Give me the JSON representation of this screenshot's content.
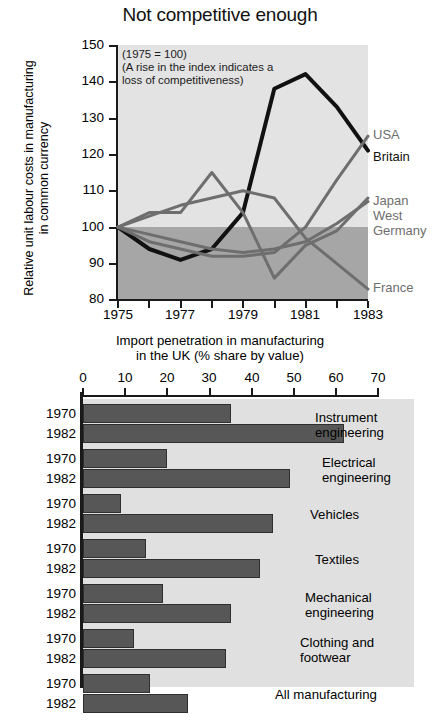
{
  "line_chart": {
    "title": "Not competitive enough",
    "ylabel": "Relative unit labour costs in manufacturing\nin common currency",
    "note": "(1975 = 100)\n(A rise in the index indicates a\nloss of competitiveness)",
    "note_lines": [
      "(1975 = 100)",
      "(A rise in the index indicates a",
      "loss of competitiveness)"
    ],
    "ytick_labels": [
      "150",
      "140",
      "130",
      "120",
      "110",
      "100",
      "90",
      "80"
    ],
    "xtick_labels": [
      "1975",
      "1977",
      "1979",
      "1981",
      "1983"
    ],
    "series_labels": [
      "USA",
      "Britain",
      "Japan",
      "West",
      "Germany",
      "France"
    ]
  },
  "bar_chart": {
    "title_lines": [
      "Import penetration in manufacturing",
      "in the UK (% share by value)"
    ],
    "xtick_labels": [
      "0",
      "10",
      "20",
      "30",
      "40",
      "50",
      "60",
      "70"
    ],
    "year_labels": [
      "1970",
      "1982"
    ],
    "category_labels": [
      [
        "Instrument",
        "engineering"
      ],
      [
        "Electrical",
        "engineering"
      ],
      [
        "Vehicles"
      ],
      [
        "Textiles"
      ],
      [
        "Mechanical",
        "engineering"
      ],
      [
        "Clothing and",
        "footwear"
      ],
      [
        "All manufacturing"
      ]
    ]
  },
  "footer": {
    "text": ""
  },
  "colors": {
    "plot_light": "#e3e3e3",
    "plot_dark": "#a6a6a6",
    "bar_fill": "#575757",
    "bar_bg": "#e0e0e0",
    "line_black": "#111111",
    "line_gray": "#6e6e6e"
  },
  "chart_data": [
    {
      "type": "line",
      "title": "Not competitive enough",
      "xlabel": "",
      "ylabel": "Relative unit labour costs in manufacturing in common currency",
      "subtitle": "(1975 = 100) (A rise in the index indicates a loss of competitiveness)",
      "x": [
        1975,
        1976,
        1977,
        1978,
        1979,
        1980,
        1981,
        1982,
        1983
      ],
      "xlim": [
        1975,
        1983
      ],
      "ylim": [
        80,
        150
      ],
      "yticks": [
        80,
        90,
        100,
        110,
        120,
        130,
        140,
        150
      ],
      "xticks": [
        1975,
        1977,
        1979,
        1981,
        1983
      ],
      "grid": false,
      "legend": "right-inline",
      "series": [
        {
          "name": "Britain",
          "color": "#111111",
          "values": [
            100,
            94,
            91,
            94,
            104,
            138,
            142,
            133,
            121
          ]
        },
        {
          "name": "USA",
          "color": "#6e6e6e",
          "values": [
            100,
            96,
            94,
            92,
            92,
            93,
            100,
            113,
            125
          ]
        },
        {
          "name": "Japan",
          "color": "#6e6e6e",
          "values": [
            100,
            104,
            104,
            115,
            104,
            86,
            95,
            99,
            108
          ]
        },
        {
          "name": "West Germany",
          "color": "#6e6e6e",
          "values": [
            100,
            98,
            96,
            94,
            93,
            94,
            96,
            101,
            107
          ]
        },
        {
          "name": "France",
          "color": "#6e6e6e",
          "values": [
            100,
            103,
            106,
            108,
            110,
            108,
            97,
            90,
            83
          ]
        }
      ]
    },
    {
      "type": "bar",
      "orientation": "horizontal",
      "title": "Import penetration in manufacturing in the UK (% share by value)",
      "xlabel": "% share by value",
      "ylabel": "",
      "xlim": [
        0,
        70
      ],
      "xticks": [
        0,
        10,
        20,
        30,
        40,
        50,
        60,
        70
      ],
      "grid": false,
      "categories": [
        "Instrument engineering",
        "Electrical engineering",
        "Vehicles",
        "Textiles",
        "Mechanical engineering",
        "Clothing and footwear",
        "All manufacturing"
      ],
      "series": [
        {
          "name": "1970",
          "values": [
            35,
            20,
            9,
            15,
            19,
            12,
            16
          ]
        },
        {
          "name": "1982",
          "values": [
            62,
            49,
            45,
            42,
            35,
            34,
            25
          ]
        }
      ]
    }
  ]
}
